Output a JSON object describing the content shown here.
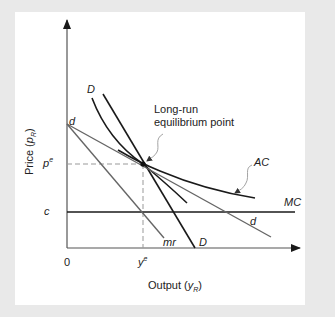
{
  "diagram": {
    "y_axis_label": "Price (",
    "y_axis_var": "p",
    "y_axis_sub": "R",
    "x_axis_label": "Output (",
    "x_axis_var": "y",
    "x_axis_sub": "R",
    "origin": "0",
    "price_eq": "p",
    "price_eq_sup": "e",
    "cost_level": "c",
    "output_eq": "y",
    "output_eq_sup": "e",
    "annotation_line1": "Long-run",
    "annotation_line2": "equilibrium point",
    "curves": {
      "D_top": "D",
      "D_bottom": "D",
      "d_top": "d",
      "d_bottom": "d",
      "AC": "AC",
      "MC": "MC",
      "mr": "mr"
    },
    "close_paren": ")"
  },
  "colors": {
    "background": "#e9e9e9",
    "panel": "#ffffff",
    "line_dark": "#1a1a1a",
    "line_gray": "#666666",
    "dashed": "#999999"
  }
}
